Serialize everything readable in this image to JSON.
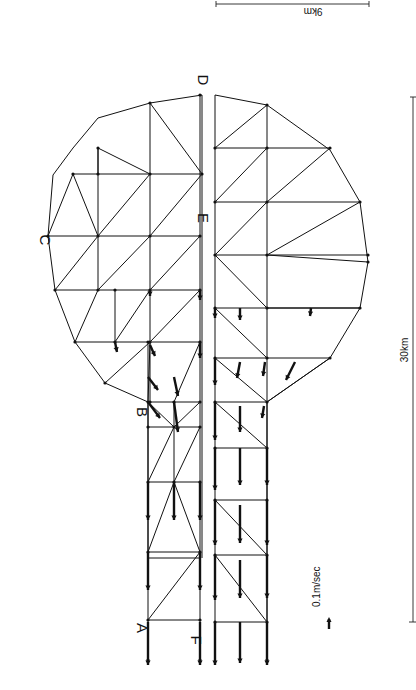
{
  "figure": {
    "orientation_deg": 90,
    "labels": [
      {
        "id": "A",
        "text": "A",
        "x": 137,
        "y": 628
      },
      {
        "id": "B",
        "text": "B",
        "x": 137,
        "y": 412
      },
      {
        "id": "C",
        "text": "C",
        "x": 40,
        "y": 240
      },
      {
        "id": "D",
        "text": "D",
        "x": 198,
        "y": 80
      },
      {
        "id": "E",
        "text": "E",
        "x": 198,
        "y": 218
      },
      {
        "id": "F",
        "text": "F",
        "x": 191,
        "y": 640
      }
    ],
    "scale_bars": {
      "width": {
        "text": "9 km",
        "label_display": "9km",
        "x1": 216,
        "x2": 369,
        "y": 4,
        "text_x": 313,
        "text_y": 16
      },
      "length": {
        "text": "30 km",
        "label_display": "30km",
        "x": 413,
        "y1": 97,
        "y2": 622,
        "text_x": 408,
        "text_y": 350
      },
      "velocity": {
        "text": "0.1 m/sec",
        "label_display": "0.1m/sec",
        "x": 320,
        "y": 625,
        "arrow_len": 10
      }
    },
    "upper_mesh": {
      "outline": [
        [
          200,
          558
        ],
        [
          148,
          558
        ],
        [
          148,
          402
        ],
        [
          105,
          383
        ],
        [
          75,
          342
        ],
        [
          55,
          290
        ],
        [
          48,
          236
        ],
        [
          53,
          175
        ],
        [
          73,
          148
        ],
        [
          98,
          118
        ],
        [
          150,
          103
        ],
        [
          202,
          95
        ],
        [
          202,
          558
        ]
      ],
      "horizontals": [
        [
          148,
          402,
          200,
          402
        ],
        [
          148,
          427,
          200,
          427
        ],
        [
          148,
          482,
          200,
          482
        ],
        [
          148,
          552,
          200,
          552
        ],
        [
          148,
          620,
          200,
          620
        ],
        [
          75,
          342,
          200,
          342
        ],
        [
          55,
          290,
          200,
          290
        ],
        [
          48,
          236,
          200,
          236
        ],
        [
          73,
          174,
          202,
          174
        ],
        [
          98,
          148,
          98,
          174
        ]
      ],
      "verticals": [
        [
          148,
          342,
          148,
          660
        ],
        [
          200,
          95,
          200,
          660
        ],
        [
          174,
          402,
          174,
          482
        ],
        [
          150,
          103,
          150,
          236
        ],
        [
          98,
          148,
          98,
          290
        ],
        [
          150,
          236,
          150,
          402
        ],
        [
          115,
          342,
          115,
          290
        ]
      ],
      "diagonals": [
        [
          148,
          620,
          200,
          552
        ],
        [
          148,
          552,
          174,
          482
        ],
        [
          174,
          482,
          200,
          552
        ],
        [
          148,
          482,
          174,
          427
        ],
        [
          174,
          482,
          200,
          427
        ],
        [
          148,
          402,
          174,
          427
        ],
        [
          174,
          427,
          200,
          402
        ],
        [
          174,
          402,
          200,
          342
        ],
        [
          148,
          402,
          150,
          342
        ],
        [
          105,
          383,
          150,
          342
        ],
        [
          150,
          342,
          200,
          290
        ],
        [
          115,
          342,
          150,
          290
        ],
        [
          75,
          342,
          98,
          290
        ],
        [
          98,
          290,
          150,
          236
        ],
        [
          150,
          290,
          200,
          236
        ],
        [
          55,
          290,
          98,
          236
        ],
        [
          98,
          236,
          150,
          174
        ],
        [
          150,
          236,
          202,
          174
        ],
        [
          48,
          236,
          73,
          174
        ],
        [
          73,
          174,
          98,
          236
        ],
        [
          98,
          148,
          150,
          174
        ],
        [
          150,
          103,
          202,
          174
        ]
      ]
    },
    "lower_mesh": {
      "outline": [
        [
          215,
          660
        ],
        [
          215,
          95
        ],
        [
          267,
          105
        ],
        [
          330,
          150
        ],
        [
          360,
          202
        ],
        [
          368,
          262
        ],
        [
          360,
          308
        ],
        [
          330,
          358
        ],
        [
          267,
          402
        ],
        [
          267,
          660
        ]
      ],
      "horizontals": [
        [
          215,
          148,
          330,
          148
        ],
        [
          215,
          202,
          360,
          202
        ],
        [
          215,
          255,
          368,
          255
        ],
        [
          215,
          308,
          360,
          308
        ],
        [
          215,
          358,
          330,
          358
        ],
        [
          215,
          402,
          267,
          402
        ],
        [
          215,
          448,
          267,
          448
        ],
        [
          215,
          500,
          267,
          500
        ],
        [
          215,
          555,
          267,
          555
        ],
        [
          215,
          622,
          267,
          622
        ]
      ],
      "verticals": [
        [
          267,
          105,
          267,
          660
        ]
      ],
      "diagonals": [
        [
          215,
          148,
          267,
          105
        ],
        [
          215,
          202,
          267,
          148
        ],
        [
          267,
          202,
          330,
          148
        ],
        [
          215,
          255,
          267,
          202
        ],
        [
          267,
          255,
          360,
          202
        ],
        [
          215,
          255,
          267,
          308
        ],
        [
          267,
          255,
          368,
          262
        ],
        [
          215,
          308,
          267,
          358
        ],
        [
          267,
          308,
          360,
          308
        ],
        [
          215,
          358,
          267,
          402
        ],
        [
          267,
          402,
          330,
          358
        ],
        [
          215,
          402,
          267,
          448
        ],
        [
          215,
          500,
          267,
          555
        ],
        [
          215,
          555,
          267,
          622
        ]
      ]
    },
    "velocity_vectors": [
      {
        "x1": 148,
        "y1": 622,
        "x2": 148,
        "y2": 665
      },
      {
        "x1": 200,
        "y1": 622,
        "x2": 200,
        "y2": 665
      },
      {
        "x1": 148,
        "y1": 552,
        "x2": 148,
        "y2": 590
      },
      {
        "x1": 200,
        "y1": 552,
        "x2": 200,
        "y2": 590
      },
      {
        "x1": 148,
        "y1": 482,
        "x2": 148,
        "y2": 520
      },
      {
        "x1": 174,
        "y1": 482,
        "x2": 174,
        "y2": 520
      },
      {
        "x1": 200,
        "y1": 482,
        "x2": 200,
        "y2": 520
      },
      {
        "x1": 215,
        "y1": 622,
        "x2": 215,
        "y2": 665
      },
      {
        "x1": 240,
        "y1": 622,
        "x2": 240,
        "y2": 663
      },
      {
        "x1": 267,
        "y1": 622,
        "x2": 267,
        "y2": 665
      },
      {
        "x1": 215,
        "y1": 555,
        "x2": 215,
        "y2": 600
      },
      {
        "x1": 240,
        "y1": 560,
        "x2": 240,
        "y2": 598
      },
      {
        "x1": 267,
        "y1": 555,
        "x2": 267,
        "y2": 598
      },
      {
        "x1": 215,
        "y1": 500,
        "x2": 215,
        "y2": 545
      },
      {
        "x1": 240,
        "y1": 505,
        "x2": 240,
        "y2": 543
      },
      {
        "x1": 267,
        "y1": 500,
        "x2": 267,
        "y2": 545
      },
      {
        "x1": 215,
        "y1": 448,
        "x2": 215,
        "y2": 490
      },
      {
        "x1": 240,
        "y1": 448,
        "x2": 240,
        "y2": 485
      },
      {
        "x1": 267,
        "y1": 448,
        "x2": 267,
        "y2": 485
      },
      {
        "x1": 215,
        "y1": 402,
        "x2": 215,
        "y2": 440
      },
      {
        "x1": 240,
        "y1": 406,
        "x2": 240,
        "y2": 432
      },
      {
        "x1": 264,
        "y1": 406,
        "x2": 262,
        "y2": 418
      },
      {
        "x1": 215,
        "y1": 358,
        "x2": 215,
        "y2": 385
      },
      {
        "x1": 240,
        "y1": 362,
        "x2": 237,
        "y2": 378
      },
      {
        "x1": 265,
        "y1": 362,
        "x2": 263,
        "y2": 376
      },
      {
        "x1": 295,
        "y1": 362,
        "x2": 286,
        "y2": 380
      },
      {
        "x1": 215,
        "y1": 308,
        "x2": 215,
        "y2": 318
      },
      {
        "x1": 240,
        "y1": 308,
        "x2": 240,
        "y2": 320
      },
      {
        "x1": 311,
        "y1": 308,
        "x2": 310,
        "y2": 316
      },
      {
        "x1": 148,
        "y1": 402,
        "x2": 160,
        "y2": 418
      },
      {
        "x1": 148,
        "y1": 377,
        "x2": 158,
        "y2": 390
      },
      {
        "x1": 174,
        "y1": 377,
        "x2": 178,
        "y2": 396
      },
      {
        "x1": 174,
        "y1": 402,
        "x2": 178,
        "y2": 432
      },
      {
        "x1": 200,
        "y1": 342,
        "x2": 200,
        "y2": 358
      },
      {
        "x1": 150,
        "y1": 345,
        "x2": 155,
        "y2": 356
      },
      {
        "x1": 115,
        "y1": 342,
        "x2": 117,
        "y2": 352
      },
      {
        "x1": 200,
        "y1": 290,
        "x2": 200,
        "y2": 300
      },
      {
        "x1": 150,
        "y1": 290,
        "x2": 150,
        "y2": 296
      }
    ]
  }
}
